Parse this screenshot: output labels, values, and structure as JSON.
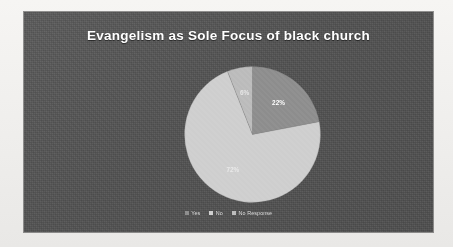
{
  "chart_data": {
    "type": "pie",
    "title": "Evangelism as Sole Focus of black church",
    "categories": [
      "Yes",
      "No",
      "No Response"
    ],
    "values": [
      22,
      72,
      6
    ],
    "value_labels": [
      "22%",
      "72%",
      "6%"
    ],
    "colors": [
      "#8f8f8f",
      "#cfcfcf",
      "#bdbdbd"
    ],
    "legend_position": "bottom",
    "grid": false,
    "start_angle_deg": 0,
    "direction": "clockwise",
    "xlabel": "",
    "ylabel": ""
  },
  "panel": {
    "background_color": "#545454",
    "title_color": "#ffffff"
  },
  "legend": {
    "items": [
      {
        "label": "Yes",
        "color": "#8f8f8f"
      },
      {
        "label": "No",
        "color": "#cfcfcf"
      },
      {
        "label": "No Response",
        "color": "#bdbdbd"
      }
    ]
  }
}
